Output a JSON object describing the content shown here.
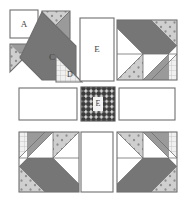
{
  "figure": {
    "kind": "quilt-block-piecing-diagram",
    "width": 183,
    "height": 202
  },
  "colors": {
    "background": "#ffffff",
    "outline": "#6f6f6f",
    "outline_dark": "#555555",
    "fabric_plain": "#ffffff",
    "fabric_dark": "#767676",
    "fabric_medium": "#9a9a9a",
    "fabric_crosshatch_bg": "#f0f0f0",
    "fabric_crosshatch_line": "#b4b4b4",
    "fabric_dotted_bg": "#cfcfcf",
    "fabric_dotted_dot": "#8d8d8d",
    "fabric_center_bg": "#3b3b3b",
    "fabric_center_dot": "#ffffff",
    "label_text": "#444444",
    "label_text_light": "#f2f2f2"
  },
  "labels": {
    "a": "A",
    "b": "B",
    "c": "C",
    "d": "D",
    "e_top": "E",
    "e_center": "E"
  },
  "legend_pieces": [
    {
      "id": "A",
      "label": "A",
      "shape": "square",
      "fabric": "plain"
    },
    {
      "id": "B",
      "label": "B",
      "shape": "triangle",
      "fabric": "medium"
    },
    {
      "id": "C",
      "label": "C",
      "shape": "triangle",
      "fabric": "dark"
    },
    {
      "id": "D",
      "label": "D",
      "shape": "triangle",
      "fabric": "crosshatch"
    },
    {
      "id": "E",
      "label": "E",
      "shape": "rectangle",
      "fabric": "plain"
    }
  ],
  "layout": {
    "rows": 3,
    "cols": 3,
    "cells": [
      {
        "row": 0,
        "col": 0,
        "name": "exploded-pieces-panel"
      },
      {
        "row": 0,
        "col": 1,
        "name": "sash-rect-top"
      },
      {
        "row": 0,
        "col": 2,
        "name": "assembled-block-top-right"
      },
      {
        "row": 1,
        "col": 0,
        "name": "sash-rect-left"
      },
      {
        "row": 1,
        "col": 1,
        "name": "center-square"
      },
      {
        "row": 1,
        "col": 2,
        "name": "sash-rect-right"
      },
      {
        "row": 2,
        "col": 0,
        "name": "assembled-block-bottom-left"
      },
      {
        "row": 2,
        "col": 1,
        "name": "sash-rect-bottom"
      },
      {
        "row": 2,
        "col": 2,
        "name": "assembled-block-bottom-right"
      }
    ]
  }
}
